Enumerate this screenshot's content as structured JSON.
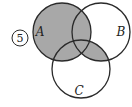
{
  "figure": {
    "problem_number": "5",
    "sets": [
      {
        "name": "A",
        "cx": 62,
        "cy": 32,
        "r": 29,
        "label_x": 40,
        "label_y": 36
      },
      {
        "name": "B",
        "cx": 101,
        "cy": 32,
        "r": 29,
        "label_x": 120,
        "label_y": 36
      },
      {
        "name": "C",
        "cx": 81,
        "cy": 69,
        "r": 29,
        "label_x": 77,
        "label_y": 95
      }
    ],
    "shaded_region": "A ∪ (B ∩ C)",
    "colors": {
      "shade": "#a8a8a8",
      "stroke": "#2a2a2a",
      "background": "#ffffff"
    }
  }
}
